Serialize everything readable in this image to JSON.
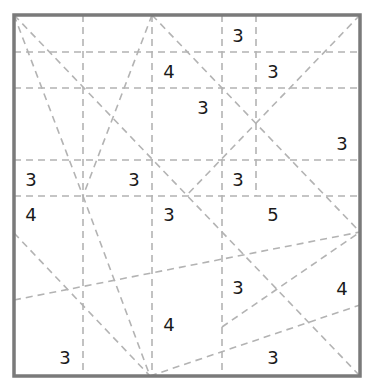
{
  "puzzle": {
    "type": "slitherlink-style region puzzle",
    "frame": {
      "x1": 14,
      "y1": 15,
      "x2": 360,
      "y2": 376,
      "color": "#7a7a7a"
    },
    "guide_color": "#b3b3b3",
    "horizontal_lines": [
      {
        "x1": 14,
        "y1": 52,
        "x2": 360,
        "y2": 52
      },
      {
        "x1": 14,
        "y1": 88,
        "x2": 360,
        "y2": 88
      },
      {
        "x1": 14,
        "y1": 160,
        "x2": 360,
        "y2": 160
      },
      {
        "x1": 14,
        "y1": 196,
        "x2": 360,
        "y2": 196
      }
    ],
    "vertical_lines": [
      {
        "x1": 83,
        "y1": 15,
        "x2": 83,
        "y2": 376
      },
      {
        "x1": 152,
        "y1": 15,
        "x2": 152,
        "y2": 376
      },
      {
        "x1": 222,
        "y1": 15,
        "x2": 222,
        "y2": 376
      },
      {
        "x1": 256,
        "y1": 15,
        "x2": 256,
        "y2": 196
      }
    ],
    "diagonal_lines": [
      {
        "x1": 14,
        "y1": 15,
        "x2": 360,
        "y2": 376
      },
      {
        "x1": 14,
        "y1": 15,
        "x2": 83,
        "y2": 196
      },
      {
        "x1": 152,
        "y1": 15,
        "x2": 83,
        "y2": 196
      },
      {
        "x1": 83,
        "y1": 196,
        "x2": 150,
        "y2": 376
      },
      {
        "x1": 152,
        "y1": 15,
        "x2": 360,
        "y2": 232
      },
      {
        "x1": 360,
        "y1": 15,
        "x2": 186,
        "y2": 196
      },
      {
        "x1": 14,
        "y1": 233,
        "x2": 150,
        "y2": 376
      },
      {
        "x1": 14,
        "y1": 300,
        "x2": 360,
        "y2": 232
      },
      {
        "x1": 222,
        "y1": 327,
        "x2": 360,
        "y2": 232
      },
      {
        "x1": 150,
        "y1": 376,
        "x2": 360,
        "y2": 305
      }
    ],
    "clues": [
      {
        "value": "3",
        "x": 238,
        "y": 35
      },
      {
        "value": "4",
        "x": 169,
        "y": 71
      },
      {
        "value": "3",
        "x": 273,
        "y": 71
      },
      {
        "value": "3",
        "x": 203,
        "y": 107
      },
      {
        "value": "3",
        "x": 342,
        "y": 143
      },
      {
        "value": "3",
        "x": 31,
        "y": 179
      },
      {
        "value": "3",
        "x": 134,
        "y": 179
      },
      {
        "value": "3",
        "x": 238,
        "y": 179
      },
      {
        "value": "4",
        "x": 31,
        "y": 214
      },
      {
        "value": "3",
        "x": 169,
        "y": 214
      },
      {
        "value": "5",
        "x": 273,
        "y": 214
      },
      {
        "value": "3",
        "x": 238,
        "y": 287
      },
      {
        "value": "4",
        "x": 342,
        "y": 288
      },
      {
        "value": "4",
        "x": 169,
        "y": 324
      },
      {
        "value": "3",
        "x": 65,
        "y": 357
      },
      {
        "value": "3",
        "x": 273,
        "y": 357
      }
    ]
  }
}
